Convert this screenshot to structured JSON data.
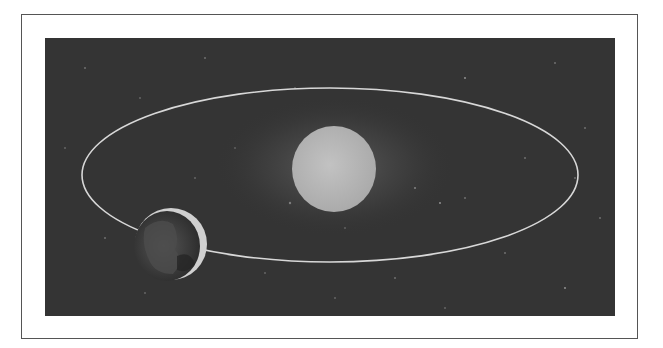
{
  "figure": {
    "colors": {
      "background": "#343434",
      "orbit": "#d8d8d8",
      "sun": "#b9b9b9",
      "earth": "#3a3a3a",
      "earth_crescent": "#d0d0d0",
      "frame": "#555555"
    },
    "elements": [
      {
        "name": "sun",
        "label": "Sun"
      },
      {
        "name": "earth",
        "label": "Earth"
      },
      {
        "name": "orbit",
        "label": "Orbit (ellipse)"
      }
    ]
  }
}
